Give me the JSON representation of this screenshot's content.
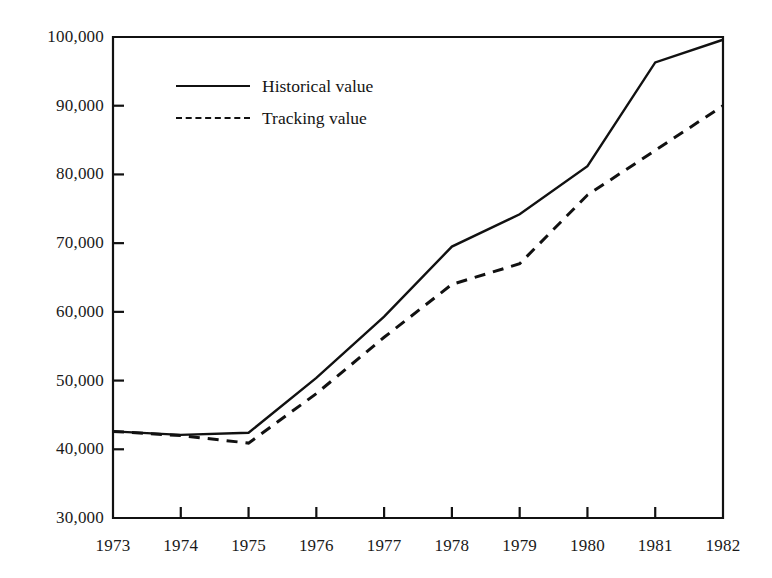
{
  "chart_data": {
    "type": "line",
    "title": "",
    "xlabel": "",
    "ylabel": "",
    "grid": false,
    "legend_position": "inside-top-left",
    "categories": [
      "1973",
      "1974",
      "1975",
      "1976",
      "1977",
      "1978",
      "1979",
      "1980",
      "1981",
      "1982"
    ],
    "x": [
      1973,
      1974,
      1975,
      1976,
      1977,
      1978,
      1979,
      1980,
      1981,
      1982
    ],
    "xlim": [
      1973,
      1982
    ],
    "ylim": [
      30000,
      100000
    ],
    "ytick_labels": [
      "30,000",
      "40,000",
      "50,000",
      "60,000",
      "70,000",
      "80,000",
      "90,000",
      "100,000"
    ],
    "yticks": [
      30000,
      40000,
      50000,
      60000,
      70000,
      80000,
      90000,
      100000
    ],
    "xtick_labels": [
      "1973",
      "1974",
      "1975",
      "1976",
      "1977",
      "1978",
      "1979",
      "1980",
      "1981",
      "1982"
    ],
    "series": [
      {
        "name": "Historical value",
        "style": "solid",
        "color": "#111111",
        "values": [
          42600,
          42100,
          42400,
          50400,
          59300,
          69500,
          74200,
          81200,
          96300,
          99600
        ]
      },
      {
        "name": "Tracking value",
        "style": "dashed",
        "color": "#111111",
        "values": [
          42600,
          42000,
          40900,
          48100,
          56300,
          64000,
          67000,
          77000,
          83500,
          90000
        ]
      }
    ]
  },
  "legend": {
    "items": [
      {
        "label": "Historical value",
        "style": "solid"
      },
      {
        "label": "Tracking value",
        "style": "dashed"
      }
    ]
  }
}
